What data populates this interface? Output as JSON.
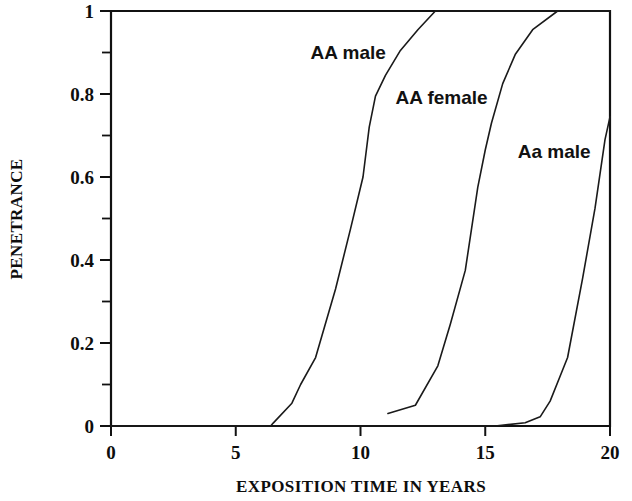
{
  "chart_data": {
    "type": "line",
    "title": "",
    "xlabel": "EXPOSITION TIME IN YEARS",
    "ylabel": "PENETRANCE",
    "xlim": [
      0,
      20
    ],
    "ylim": [
      0,
      1
    ],
    "grid": false,
    "legend_position": "inline-annotations",
    "x_ticks": [
      0,
      5,
      10,
      15,
      20
    ],
    "x_tick_labels": [
      "0",
      "5",
      "10",
      "15",
      "20"
    ],
    "x_minor_ticks": [],
    "y_ticks": [
      0,
      0.2,
      0.4,
      0.6,
      0.8,
      1
    ],
    "y_tick_labels": [
      "0",
      "0.2",
      "0.4",
      "0.6",
      "0.8",
      "1"
    ],
    "y_minor_ticks": [
      0.1,
      0.3,
      0.5,
      0.7,
      0.9
    ],
    "series": [
      {
        "name": "AA male",
        "label_x": 8.0,
        "label_y": 0.885,
        "points": [
          [
            0,
            0
          ],
          [
            6.4,
            0
          ],
          [
            6.5,
            0.007
          ],
          [
            7.25,
            0.055
          ],
          [
            7.6,
            0.1
          ],
          [
            8.2,
            0.165
          ],
          [
            9.0,
            0.33
          ],
          [
            9.6,
            0.475
          ],
          [
            10.1,
            0.6
          ],
          [
            10.35,
            0.72
          ],
          [
            10.6,
            0.795
          ],
          [
            11.0,
            0.845
          ],
          [
            11.6,
            0.905
          ],
          [
            12.3,
            0.955
          ],
          [
            13.0,
            1.0
          ],
          [
            20,
            1.0
          ]
        ]
      },
      {
        "name": "AA female",
        "label_x": 11.4,
        "label_y": 0.775,
        "points": [
          [
            11.1,
            0.03
          ],
          [
            12.2,
            0.05
          ],
          [
            13.1,
            0.145
          ],
          [
            13.6,
            0.245
          ],
          [
            14.2,
            0.375
          ],
          [
            14.7,
            0.575
          ],
          [
            15.0,
            0.665
          ],
          [
            15.25,
            0.73
          ],
          [
            15.7,
            0.825
          ],
          [
            16.2,
            0.895
          ],
          [
            16.9,
            0.955
          ],
          [
            17.9,
            1.0
          ],
          [
            20,
            1.0
          ]
        ]
      },
      {
        "name": "Aa male",
        "label_x": 16.3,
        "label_y": 0.645,
        "points": [
          [
            0,
            0
          ],
          [
            15.4,
            0
          ],
          [
            16.6,
            0.008
          ],
          [
            17.2,
            0.022
          ],
          [
            17.6,
            0.06
          ],
          [
            18.0,
            0.12
          ],
          [
            18.3,
            0.165
          ],
          [
            18.9,
            0.355
          ],
          [
            19.4,
            0.525
          ],
          [
            19.8,
            0.69
          ],
          [
            20.0,
            0.745
          ]
        ]
      }
    ]
  }
}
